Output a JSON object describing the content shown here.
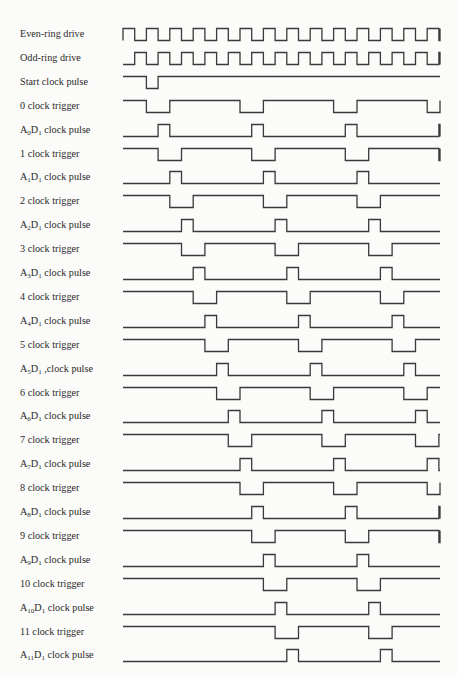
{
  "diagram": {
    "type": "timing-diagram",
    "x_start": 123,
    "x_end": 440,
    "first_row_y": 34,
    "row_pitch": 23.9,
    "amplitude": 12,
    "half_period": 11.7,
    "stroke_color": "#3a3a3a",
    "signals": [
      {
        "label": "Even-ring drive",
        "label_parts": [
          [
            "Even-ring drive",
            ""
          ]
        ],
        "kind": "even"
      },
      {
        "label": "Odd-ring drive",
        "label_parts": [
          [
            "Odd-ring drive",
            ""
          ]
        ],
        "kind": "odd"
      },
      {
        "label": "Start clock pulse",
        "label_parts": [
          [
            "Start clock pulse",
            ""
          ]
        ],
        "kind": "start"
      },
      {
        "label": "0 clock trigger",
        "label_parts": [
          [
            "0 clock trigger",
            ""
          ]
        ],
        "kind": "trigger",
        "k": 0
      },
      {
        "label": "A0D1 clock pulse",
        "label_parts": [
          [
            "A",
            "0"
          ],
          [
            "D",
            "1"
          ],
          [
            " clock pulse",
            ""
          ]
        ],
        "kind": "pulse",
        "k": 0
      },
      {
        "label": "1 clock trigger",
        "label_parts": [
          [
            "1 clock trigger",
            ""
          ]
        ],
        "kind": "trigger",
        "k": 1
      },
      {
        "label": "A1D1 clock pulse",
        "label_parts": [
          [
            "A",
            "1"
          ],
          [
            "D",
            "1"
          ],
          [
            " clock pulse",
            ""
          ]
        ],
        "kind": "pulse",
        "k": 1
      },
      {
        "label": "2 clock trigger",
        "label_parts": [
          [
            "2 clock trigger",
            ""
          ]
        ],
        "kind": "trigger",
        "k": 2
      },
      {
        "label": "A2D1 clock pulse",
        "label_parts": [
          [
            "A",
            "2"
          ],
          [
            "D",
            "1"
          ],
          [
            " clock pulse",
            ""
          ]
        ],
        "kind": "pulse",
        "k": 2
      },
      {
        "label": "3 clock trigger",
        "label_parts": [
          [
            "3 clock trigger",
            ""
          ]
        ],
        "kind": "trigger",
        "k": 3
      },
      {
        "label": "A3D1 clock pulse",
        "label_parts": [
          [
            "A",
            "3"
          ],
          [
            "D",
            "1"
          ],
          [
            " clock pulse",
            ""
          ]
        ],
        "kind": "pulse",
        "k": 3
      },
      {
        "label": "4 clock trigger",
        "label_parts": [
          [
            "4 clock trigger",
            ""
          ]
        ],
        "kind": "trigger",
        "k": 4
      },
      {
        "label": "A4D1 clock pulse",
        "label_parts": [
          [
            "A",
            "4"
          ],
          [
            "D",
            "1"
          ],
          [
            " clock pulse",
            ""
          ]
        ],
        "kind": "pulse",
        "k": 4
      },
      {
        "label": "5 clock trigger",
        "label_parts": [
          [
            "5 clock trigger",
            ""
          ]
        ],
        "kind": "trigger",
        "k": 5
      },
      {
        "label": "A5D1 clock pulse",
        "label_parts": [
          [
            "A",
            "5"
          ],
          [
            "D",
            "1"
          ],
          [
            " ,clock pulse",
            ""
          ]
        ],
        "kind": "pulse",
        "k": 5
      },
      {
        "label": "6 clock trigger",
        "label_parts": [
          [
            "6 clock trigger",
            ""
          ]
        ],
        "kind": "trigger",
        "k": 6
      },
      {
        "label": "A6D1 clock pulse",
        "label_parts": [
          [
            "A",
            "6"
          ],
          [
            "D",
            "1"
          ],
          [
            " clock pulse",
            ""
          ]
        ],
        "kind": "pulse",
        "k": 6
      },
      {
        "label": "7 clock trigger",
        "label_parts": [
          [
            "7 clock trigger",
            ""
          ]
        ],
        "kind": "trigger",
        "k": 7
      },
      {
        "label": "A7D1 clock pulse",
        "label_parts": [
          [
            "A",
            "7"
          ],
          [
            "D",
            "1"
          ],
          [
            " clock pulse",
            ""
          ]
        ],
        "kind": "pulse",
        "k": 7
      },
      {
        "label": "8 clock trigger",
        "label_parts": [
          [
            "8 clock trigger",
            ""
          ]
        ],
        "kind": "trigger",
        "k": 8
      },
      {
        "label": "A8D1 clock pulse",
        "label_parts": [
          [
            "A",
            "8"
          ],
          [
            "D",
            "1"
          ],
          [
            " clock pulse",
            ""
          ]
        ],
        "kind": "pulse",
        "k": 8
      },
      {
        "label": "9 clock trigger",
        "label_parts": [
          [
            "9 clock trigger",
            ""
          ]
        ],
        "kind": "trigger",
        "k": 9
      },
      {
        "label": "A9D1 clock pulse",
        "label_parts": [
          [
            "A",
            "9"
          ],
          [
            "D",
            "1"
          ],
          [
            " clock pulse",
            ""
          ]
        ],
        "kind": "pulse",
        "k": 9
      },
      {
        "label": "10 clock trigger",
        "label_parts": [
          [
            "10 clock trigger",
            ""
          ]
        ],
        "kind": "trigger",
        "k": 10
      },
      {
        "label": "A10D1 clock pulse",
        "label_parts": [
          [
            "A",
            "10"
          ],
          [
            "D",
            "1"
          ],
          [
            " clock pulse",
            ""
          ]
        ],
        "kind": "pulse",
        "k": 10
      },
      {
        "label": "11 clock trigger",
        "label_parts": [
          [
            "11 clock trigger",
            ""
          ]
        ],
        "kind": "trigger",
        "k": 11
      },
      {
        "label": "A11D1 clock pulse",
        "label_parts": [
          [
            "A",
            "11"
          ],
          [
            "D",
            "1"
          ],
          [
            " clock pulse",
            ""
          ]
        ],
        "kind": "pulse",
        "k": 11
      }
    ]
  }
}
